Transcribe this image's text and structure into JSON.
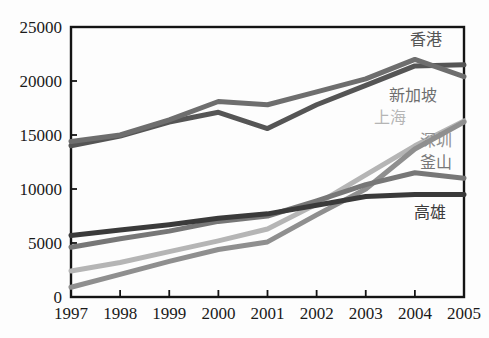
{
  "chart_data": {
    "type": "line",
    "title": "",
    "subtitle": "",
    "xlabel": "",
    "ylabel": "",
    "categories": [
      "1997",
      "1998",
      "1999",
      "2000",
      "2001",
      "2002",
      "2003",
      "2004",
      "2005"
    ],
    "x": [
      1997,
      1998,
      1999,
      2000,
      2001,
      2002,
      2003,
      2004,
      2005
    ],
    "ylim": [
      0,
      25000
    ],
    "xlim": [
      1997,
      2005
    ],
    "y_ticks": [
      "0",
      "5000",
      "10000",
      "15000",
      "20000",
      "25000"
    ],
    "y_tick_values": [
      0,
      5000,
      10000,
      15000,
      20000,
      25000
    ],
    "grid": false,
    "legend_position": "inline-right-annotations",
    "series": [
      {
        "name": "香港",
        "color": "#555555",
        "values": [
          14000,
          14900,
          16200,
          17100,
          15600,
          17800,
          19600,
          21400,
          21500
        ]
      },
      {
        "name": "新加坡",
        "color": "#6e6e6e",
        "values": [
          14400,
          15000,
          16400,
          18100,
          17800,
          19000,
          20200,
          22000,
          20400
        ]
      },
      {
        "name": "上海",
        "color": "#b5b5b5",
        "values": [
          2400,
          3200,
          4200,
          5200,
          6300,
          8600,
          11300,
          14000,
          16300
        ]
      },
      {
        "name": "深圳",
        "color": "#8f8f8f",
        "values": [
          900,
          2100,
          3300,
          4400,
          5100,
          7600,
          10000,
          13700,
          16200
        ]
      },
      {
        "name": "釜山",
        "color": "#777777",
        "values": [
          4600,
          5400,
          6100,
          7000,
          7500,
          8900,
          10400,
          11500,
          11000
        ]
      },
      {
        "name": "高雄",
        "color": "#3a3a3a",
        "values": [
          5700,
          6200,
          6700,
          7300,
          7700,
          8500,
          9300,
          9500,
          9500
        ]
      }
    ],
    "annotations": [
      {
        "text": "香港",
        "color": "#555555",
        "x": 410,
        "y": 32
      },
      {
        "text": "新加坡",
        "color": "#6e6e6e",
        "x": 389,
        "y": 88
      },
      {
        "text": "上海",
        "color": "#b5b5b5",
        "x": 374,
        "y": 110
      },
      {
        "text": "深圳",
        "color": "#8f8f8f",
        "x": 420,
        "y": 133
      },
      {
        "text": "釜山",
        "color": "#777777",
        "x": 420,
        "y": 155
      },
      {
        "text": "高雄",
        "color": "#3a3a3a",
        "x": 414,
        "y": 205
      }
    ]
  }
}
